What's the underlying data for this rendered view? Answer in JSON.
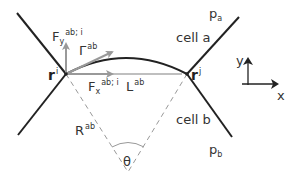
{
  "diagram": {
    "type": "cell-junction-geometry",
    "colors": {
      "edge": "#222222",
      "vector": "#999999",
      "dashed": "#999999",
      "text": "#333333"
    },
    "labels": {
      "Fy": {
        "base": "F",
        "sub": "y",
        "sup": "ab; i"
      },
      "Gamma": {
        "base": "Γ",
        "sup": "ab"
      },
      "Fx": {
        "base": "F",
        "sub": "x",
        "sup": "ab; i"
      },
      "L": {
        "base": "L",
        "sup": "ab"
      },
      "ri": {
        "base": "r",
        "sup": "i"
      },
      "rj": {
        "base": "r",
        "sup": "j"
      },
      "R": {
        "base": "R",
        "sup": "ab"
      },
      "theta": "θ",
      "pa": {
        "base": "p",
        "sub": "a"
      },
      "pb": {
        "base": "p",
        "sub": "b"
      },
      "cell_a": "cell a",
      "cell_b": "cell b",
      "axis_x": "x",
      "axis_y": "y"
    }
  }
}
